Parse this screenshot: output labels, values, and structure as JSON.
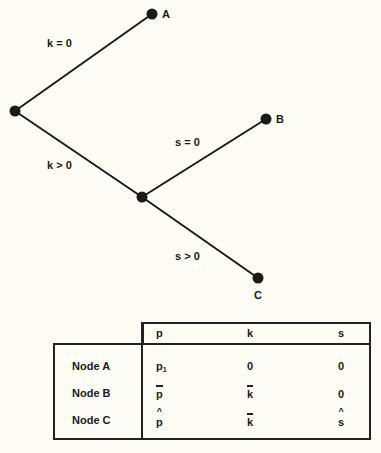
{
  "tree": {
    "nodes": [
      {
        "id": "root",
        "label": ""
      },
      {
        "id": "A",
        "label": "A"
      },
      {
        "id": "mid",
        "label": ""
      },
      {
        "id": "B",
        "label": "B"
      },
      {
        "id": "C",
        "label": "C"
      }
    ],
    "edges": [
      {
        "from": "root",
        "to": "A",
        "label": "k = 0"
      },
      {
        "from": "root",
        "to": "mid",
        "label": "k > 0"
      },
      {
        "from": "mid",
        "to": "B",
        "label": "s = 0"
      },
      {
        "from": "mid",
        "to": "C",
        "label": "s > 0"
      }
    ]
  },
  "table": {
    "columns": [
      "p",
      "k",
      "s"
    ],
    "rows": [
      {
        "label": "Node A",
        "p": "p",
        "p_sub": "1",
        "p_mark": "subscript",
        "k": "0",
        "k_mark": "none",
        "s": "0",
        "s_mark": "none"
      },
      {
        "label": "Node B",
        "p": "p",
        "p_mark": "bar",
        "k": "k",
        "k_mark": "bar",
        "s": "0",
        "s_mark": "none"
      },
      {
        "label": "Node C",
        "p": "p",
        "p_mark": "hat",
        "k": "k",
        "k_mark": "bar",
        "s": "s",
        "s_mark": "hat"
      }
    ]
  }
}
